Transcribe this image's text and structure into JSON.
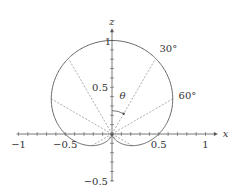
{
  "chart_data": {
    "type": "line",
    "subtype": "polar-pattern",
    "title": "",
    "xlabel": "x",
    "ylabel": "z",
    "function": "r(θ) = (1 + cos θ) / 2, θ measured from +z axis",
    "xlim": [
      -1,
      1
    ],
    "ylim": [
      -0.5,
      1
    ],
    "x_ticks": [
      -1,
      -0.5,
      0.5,
      1
    ],
    "x_tick_labels": [
      "−1",
      "−0.5",
      "0.5",
      "1"
    ],
    "z_ticks": [
      -0.5,
      0.5,
      1
    ],
    "z_tick_labels": [
      "−0.5",
      "0.5",
      "1"
    ],
    "minor_tick_step": 0.1,
    "angle_lines_deg": [
      -150,
      -120,
      -60,
      -30,
      30,
      60,
      120,
      150
    ],
    "angle_labels": [
      {
        "text": "30°",
        "angle": 30
      },
      {
        "text": "60°",
        "angle": 60
      }
    ],
    "theta_label": "θ",
    "theta_arc_angle_deg": 30,
    "sample_points": [
      {
        "theta": 0,
        "r": 1.0
      },
      {
        "theta": 30,
        "r": 0.933
      },
      {
        "theta": 60,
        "r": 0.75
      },
      {
        "theta": 90,
        "r": 0.5
      },
      {
        "theta": 120,
        "r": 0.25
      },
      {
        "theta": 150,
        "r": 0.067
      },
      {
        "theta": 180,
        "r": 0.0
      }
    ],
    "grid": false,
    "legend": null
  },
  "colors": {
    "axis": "#555555",
    "curve": "#555555",
    "dashed": "#888888",
    "text": "#333333"
  }
}
